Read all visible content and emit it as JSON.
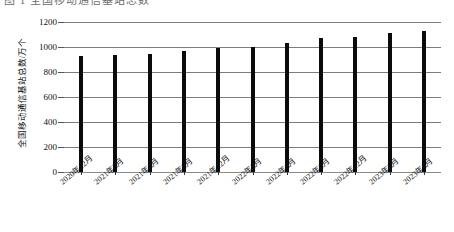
{
  "top_caption": "图 1  全国移动通信基站总数",
  "chart_data": {
    "type": "bar",
    "title": "",
    "xlabel": "",
    "ylabel": "全国移动通信基站总数/万个",
    "ylim": [
      0,
      1200
    ],
    "ytick_step": 200,
    "grid": true,
    "legend": "none",
    "bar_color": "#0b0b0b",
    "unit": "万个",
    "categories": [
      "2020年12月",
      "2021年3月",
      "2021年6月",
      "2021年9月",
      "2021年12月",
      "2022年3月",
      "2022年6月",
      "2022年9月",
      "2022年12月",
      "2023年3月",
      "2023年6月"
    ],
    "values": [
      931,
      935,
      948,
      969,
      996,
      1000,
      1033,
      1069,
      1083,
      1115,
      1129
    ],
    "yticks": [
      "0",
      "200",
      "400",
      "600",
      "800",
      "1000",
      "1200"
    ]
  }
}
